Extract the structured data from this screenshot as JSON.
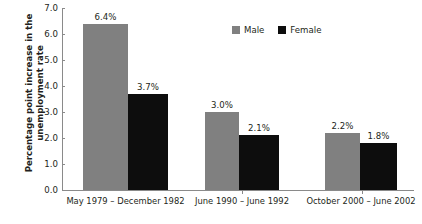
{
  "chart_data": {
    "type": "bar",
    "title": "",
    "xlabel": "",
    "ylabel": "Percentage point increase in the unemployment rate",
    "ylabel_line1": "Percentage point increase in the",
    "ylabel_line2": "unemployment rate",
    "ylim": [
      0.0,
      7.0
    ],
    "ytick_step": 1.0,
    "yticks": [
      "7.0",
      "6.0",
      "5.0",
      "4.0",
      "3.0",
      "2.0",
      "1.0",
      "0.0"
    ],
    "ytick_values": [
      7.0,
      6.0,
      5.0,
      4.0,
      3.0,
      2.0,
      1.0,
      0.0
    ],
    "grid": false,
    "legend_position": "top-right",
    "categories": [
      "May 1979 – December 1982",
      "June 1990 – June 1992",
      "October 2000 – June 2002"
    ],
    "series": [
      {
        "name": "Male",
        "color": "#808080",
        "values": [
          6.4,
          3.0,
          2.2
        ],
        "labels": [
          "6.4%",
          "3.0%",
          "2.2%"
        ]
      },
      {
        "name": "Female",
        "color": "#0d0d0d",
        "values": [
          3.7,
          2.1,
          1.8
        ],
        "labels": [
          "3.7%",
          "2.1%",
          "1.8%"
        ]
      }
    ]
  },
  "legend": {
    "items": [
      {
        "label": "Male",
        "color": "#808080"
      },
      {
        "label": "Female",
        "color": "#0d0d0d"
      }
    ]
  },
  "colors": {
    "male": "#808080",
    "female": "#0d0d0d",
    "axis": "#8a8a8a",
    "text": "#231f20",
    "background": "#ffffff"
  }
}
